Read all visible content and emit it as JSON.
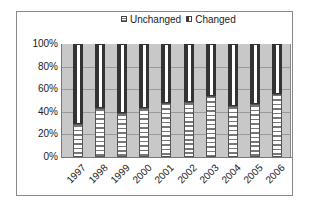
{
  "chart_data": {
    "type": "bar",
    "stacked": "percent",
    "title": "",
    "xlabel": "",
    "ylabel": "",
    "categories": [
      "1997",
      "1998",
      "1999",
      "2000",
      "2001",
      "2002",
      "2003",
      "2004",
      "2005",
      "2006"
    ],
    "series": [
      {
        "name": "Unchanged",
        "values": [
          29,
          43,
          39,
          43,
          48,
          49,
          54,
          45,
          47,
          56
        ]
      },
      {
        "name": "Changed",
        "values": [
          71,
          57,
          61,
          57,
          52,
          51,
          46,
          55,
          53,
          44
        ]
      }
    ],
    "ylim": [
      0,
      100
    ],
    "yticks": [
      "0%",
      "20%",
      "40%",
      "60%",
      "80%",
      "100%"
    ],
    "grid": true,
    "legend_position": "top",
    "colors": {
      "plot_background": "#c8c8c8",
      "changed": "#333333",
      "unchanged": "#ffffff"
    }
  },
  "legend": {
    "unchanged_label": "Unchanged",
    "changed_label": "Changed"
  }
}
